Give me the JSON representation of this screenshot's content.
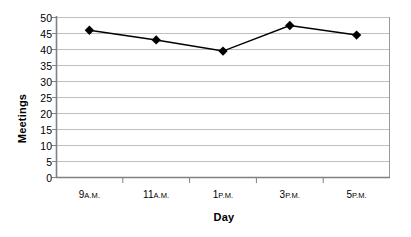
{
  "chart_data": {
    "type": "line",
    "title": "",
    "xlabel": "Day",
    "ylabel": "Meetings",
    "categories": [
      "9 A.M.",
      "11 A.M.",
      "1 P.M.",
      "3 P.M.",
      "5 P.M."
    ],
    "values": [
      46,
      43,
      39.5,
      47.5,
      44.5
    ],
    "series": [
      {
        "name": "Meetings",
        "values": [
          46,
          43,
          39.5,
          47.5,
          44.5
        ]
      }
    ],
    "ylim": [
      0,
      50
    ],
    "ytick_step": 5,
    "ytick_labels": [
      "0",
      "5",
      "10",
      "15",
      "20",
      "25",
      "30",
      "35",
      "40",
      "45",
      "50"
    ],
    "grid": "horizontal",
    "legend": "none",
    "marker": "diamond",
    "colors": {
      "line": "#000000",
      "marker": "#000000",
      "gridline": "#bfbfbf",
      "axis": "#808080",
      "background": "#ffffff"
    }
  },
  "axis": {
    "x_title": "Day",
    "y_title": "Meetings"
  },
  "x_labels": [
    {
      "number": "9",
      "ampm": "A.M."
    },
    {
      "number": "11",
      "ampm": "A.M."
    },
    {
      "number": "1",
      "ampm": "P.M."
    },
    {
      "number": "3",
      "ampm": "P.M."
    },
    {
      "number": "5",
      "ampm": "P.M."
    }
  ],
  "y_labels": [
    "50",
    "45",
    "40",
    "35",
    "30",
    "25",
    "20",
    "15",
    "10",
    "5",
    "0"
  ]
}
